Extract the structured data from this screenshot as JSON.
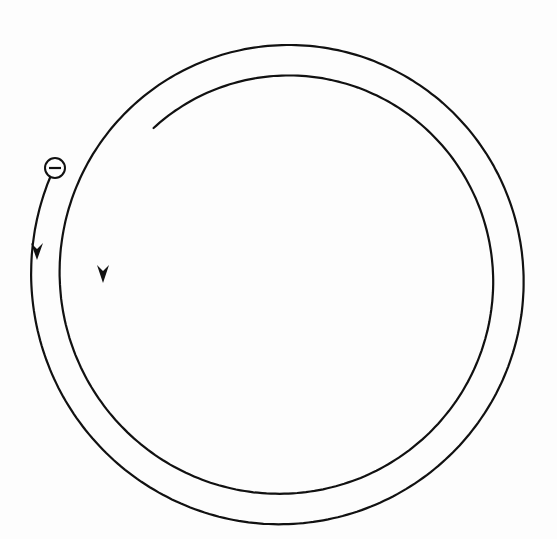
{
  "diagram": {
    "type": "spiral-path",
    "description": "Charged particle spiraling inward in a clockwise path",
    "particle": {
      "charge_symbol": "−",
      "charge_sign": "negative",
      "position": [
        55,
        172
      ]
    },
    "path": {
      "turns": 1.9,
      "direction": "clockwise",
      "center": [
        284,
        277
      ],
      "outer_radius_start": 248,
      "inner_radius_end": 198,
      "stroke_color": "#111111"
    },
    "arrows": [
      {
        "name": "outer-arrow",
        "position": [
          37,
          252
        ],
        "direction": "down"
      },
      {
        "name": "inner-arrow",
        "position": [
          103,
          275
        ],
        "direction": "down"
      }
    ],
    "background_color": "#ffffff"
  }
}
